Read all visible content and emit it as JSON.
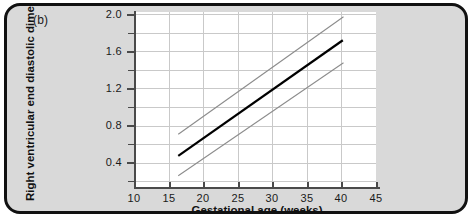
{
  "panel": {
    "label": "(b)"
  },
  "colors": {
    "card_background": "#d9d9d9",
    "card_border": "#111111",
    "plot_background": "#ffffff",
    "grid": "#c9c9c9",
    "axis": "#4a4a4a",
    "mean_line": "#000000",
    "centile_line": "#8c8c8c"
  },
  "chart_data": {
    "type": "line",
    "title": "",
    "xlabel": "Gestational age (weeks)",
    "ylabel": "Right ventricular end diastolic dimension (cm)",
    "xlim": [
      10,
      45
    ],
    "ylim": [
      0.14,
      2.0
    ],
    "xticks": [
      10,
      15,
      20,
      25,
      30,
      35,
      40,
      45
    ],
    "xtick_labels": [
      "10",
      "15",
      "20",
      "25",
      "30",
      "35",
      "40",
      "45"
    ],
    "yticks": [
      0.4,
      0.8,
      1.2,
      1.6,
      2.0
    ],
    "ytick_labels": [
      "0.4",
      "0.8",
      "1.2",
      "1.6",
      "2.0"
    ],
    "y_minor_ticks": [
      0.2,
      0.6,
      1.0,
      1.4,
      1.8
    ],
    "grid": true,
    "legend": "none",
    "series": [
      {
        "name": "upper centile",
        "style": "thin-gray",
        "x": [
          16.4,
          40.3
        ],
        "values": [
          0.7,
          1.95
        ]
      },
      {
        "name": "mean",
        "style": "thick-black",
        "x": [
          16.4,
          40.2
        ],
        "values": [
          0.47,
          1.7
        ]
      },
      {
        "name": "lower centile",
        "style": "thin-gray",
        "x": [
          16.4,
          40.3
        ],
        "values": [
          0.26,
          1.46
        ]
      }
    ]
  }
}
